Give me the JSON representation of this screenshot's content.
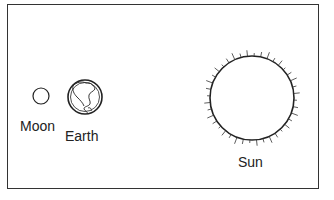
{
  "diagram": {
    "labels": {
      "moon": "Moon",
      "earth": "Earth",
      "sun": "Sun"
    },
    "colors": {
      "stroke": "#222222",
      "background": "#ffffff"
    }
  }
}
